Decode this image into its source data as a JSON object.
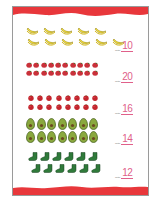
{
  "worksheet": {
    "border_color": "#e8373b",
    "total_label": "Total",
    "page_number": "11",
    "groups": [
      {
        "name": "bananas",
        "icon": "banana-icon",
        "rows": [
          5,
          5
        ],
        "total": "10",
        "color": "#f2dc3a"
      },
      {
        "name": "strawberries",
        "icon": "strawberry-icon",
        "rows": [
          10,
          10
        ],
        "total": "20",
        "color": "#c9313a"
      },
      {
        "name": "raspberries",
        "icon": "raspberry-icon",
        "rows": [
          8,
          8
        ],
        "total": "16",
        "color": "#c4262e"
      },
      {
        "name": "avocados",
        "icon": "avocado-icon",
        "rows": [
          7,
          7
        ],
        "total": "14",
        "color": "#8aa83e"
      },
      {
        "name": "socks",
        "icon": "sock-icon",
        "rows": [
          6,
          6
        ],
        "total": "12",
        "color": "#2f7a3a"
      }
    ]
  }
}
